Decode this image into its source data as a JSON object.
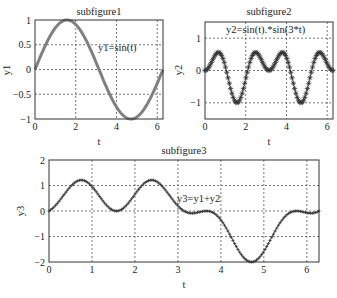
{
  "chart_data": [
    {
      "type": "line",
      "title": "subfigure1",
      "xlabel": "t",
      "ylabel": "y1",
      "annotation": "y1=sin(t)",
      "xlim": [
        0,
        6.2832
      ],
      "ylim": [
        -1,
        1
      ],
      "xticks": [
        0,
        2,
        4,
        6
      ],
      "yticks": [
        -1,
        -0.5,
        0,
        0.5,
        1
      ],
      "ytick_labels": [
        "-1",
        "-0.5",
        "0",
        "0.5",
        "1"
      ],
      "grid": true,
      "series": [
        {
          "name": "y1",
          "formula": "sin(t)",
          "color": "#808080",
          "line_width": 3,
          "marker": "none",
          "x": [
            0,
            0.785,
            1.571,
            2.356,
            3.142,
            3.927,
            4.712,
            5.498,
            6.283
          ],
          "values": [
            0,
            0.707,
            1,
            0.707,
            0,
            -0.707,
            -1,
            -0.707,
            0
          ]
        }
      ]
    },
    {
      "type": "line",
      "title": "subfigure2",
      "xlabel": "t",
      "ylabel": "y2",
      "annotation": "y2=sin(t).*sin(3*t)",
      "xlim": [
        0,
        6.2832
      ],
      "ylim": [
        -1.5,
        1.5
      ],
      "xticks": [
        0,
        2,
        4,
        6
      ],
      "yticks": [
        -1,
        0,
        1
      ],
      "ytick_labels": [
        "-1",
        "0",
        "1"
      ],
      "grid": true,
      "series": [
        {
          "name": "y2",
          "formula": "sin(t).*sin(3*t)",
          "color": "#444444",
          "line_width": 1,
          "marker": "*",
          "x": [
            0,
            0.5,
            1.05,
            1.57,
            2.1,
            2.6,
            3.14,
            3.67,
            4.19,
            4.71,
            5.24,
            5.76,
            6.28
          ],
          "values": [
            0,
            0.48,
            0.87,
            -1,
            0.0,
            0.47,
            0,
            -0.45,
            0.0,
            1,
            -0.87,
            -0.48,
            0
          ]
        }
      ]
    },
    {
      "type": "line",
      "title": "subfigure3",
      "xlabel": "t",
      "ylabel": "y3",
      "annotation": "y3=y1+y2",
      "xlim": [
        0,
        6.2832
      ],
      "ylim": [
        -2,
        2
      ],
      "xticks": [
        0,
        1,
        2,
        3,
        4,
        5,
        6
      ],
      "yticks": [
        -2,
        -1,
        0,
        1,
        2
      ],
      "ytick_labels": [
        "-2",
        "-1",
        "0",
        "1",
        "2"
      ],
      "grid": true,
      "series": [
        {
          "name": "y3",
          "formula": "sin(t)+sin(t).*sin(3*t)",
          "color": "#444444",
          "line_width": 1,
          "marker": "+",
          "x": [
            0,
            0.24,
            0.5,
            0.79,
            1.1,
            1.42,
            1.73,
            2.02,
            2.36,
            2.63,
            3.14,
            3.37,
            3.63,
            3.93,
            4.24,
            4.55,
            4.86,
            5.15,
            5.47,
            5.78,
            6.28
          ],
          "values": [
            0,
            0.38,
            0,
            1.44,
            0,
            2,
            0,
            1.85,
            0,
            0.98,
            0,
            -0.38,
            0,
            -1.44,
            0,
            -2,
            0,
            -1.75,
            0,
            -0.95,
            0
          ]
        }
      ]
    }
  ]
}
